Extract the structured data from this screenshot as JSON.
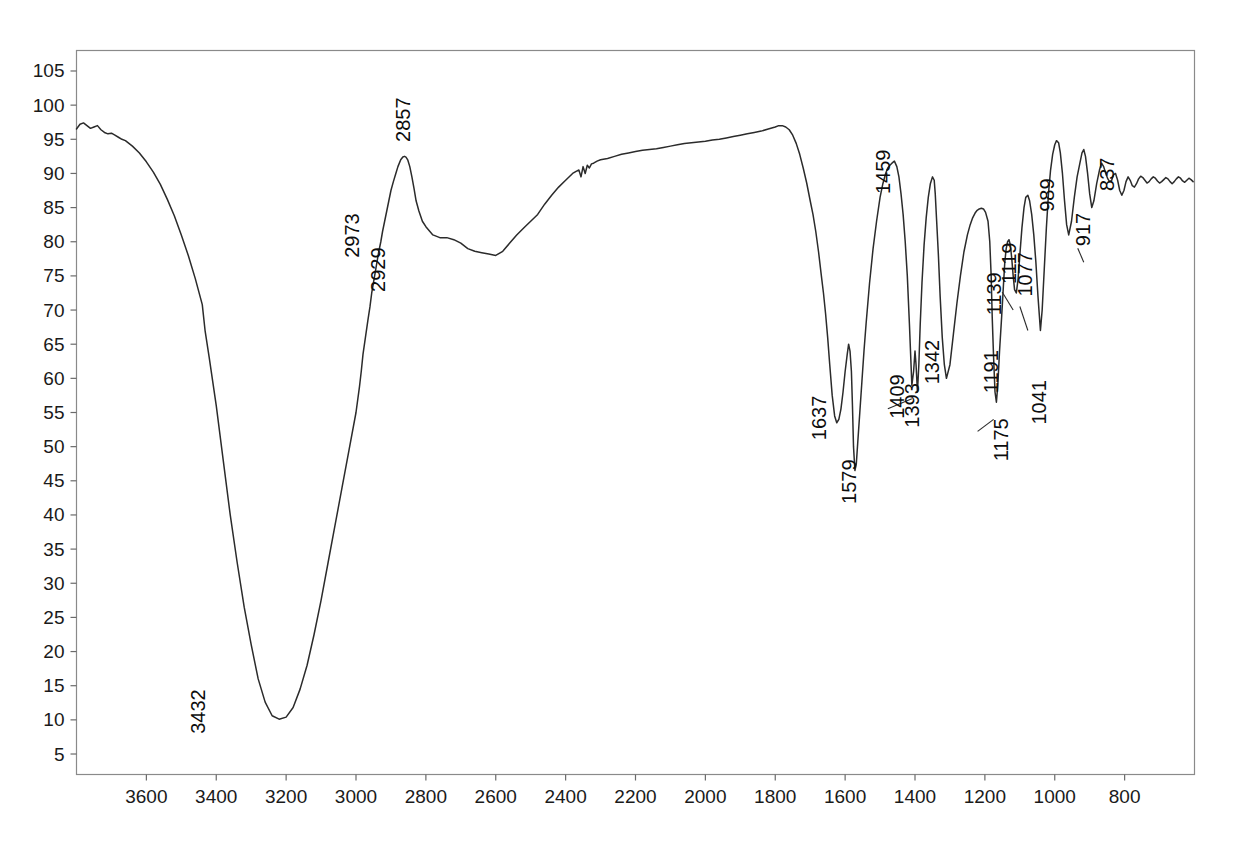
{
  "chart_data": {
    "type": "line",
    "title": "",
    "subtitle": "",
    "xlabel": "",
    "ylabel": "",
    "xlim": [
      3800,
      600
    ],
    "ylim": [
      2,
      108
    ],
    "x_axis_reversed": true,
    "grid": true,
    "legend": "none",
    "trace_color": "#2b2b2b",
    "grid_color": "#9aa0a6",
    "frame_color": "#8a8a8a",
    "x_ticks": [
      3600,
      3400,
      3200,
      3000,
      2800,
      2600,
      2400,
      2200,
      2000,
      1800,
      1600,
      1400,
      1200,
      1000,
      800
    ],
    "y_ticks": [
      5,
      10,
      15,
      20,
      25,
      30,
      35,
      40,
      45,
      50,
      55,
      60,
      65,
      70,
      75,
      80,
      85,
      90,
      95,
      100,
      105
    ],
    "x_tick_labels": [
      "3600",
      "3400",
      "3200",
      "3000",
      "2800",
      "2600",
      "2400",
      "2200",
      "2000",
      "1800",
      "1600",
      "1400",
      "1200",
      "1000",
      "800"
    ],
    "y_tick_labels": [
      "5",
      "10",
      "15",
      "20",
      "25",
      "30",
      "35",
      "40",
      "45",
      "50",
      "55",
      "60",
      "65",
      "70",
      "75",
      "80",
      "85",
      "90",
      "95",
      "100",
      "105"
    ],
    "annotations": [
      {
        "label": "3432",
        "wavenumber": 3432,
        "transmittance": 10
      },
      {
        "label": "2973",
        "wavenumber": 2973,
        "transmittance": 80
      },
      {
        "label": "2929",
        "wavenumber": 2929,
        "transmittance": 75
      },
      {
        "label": "2857",
        "wavenumber": 2857,
        "transmittance": 87
      },
      {
        "label": "1637",
        "wavenumber": 1637,
        "transmittance": 53
      },
      {
        "label": "1579",
        "wavenumber": 1579,
        "transmittance": 46
      },
      {
        "label": "1459",
        "wavenumber": 1459,
        "transmittance": 82
      },
      {
        "label": "1409",
        "wavenumber": 1409,
        "transmittance": 57
      },
      {
        "label": "1393",
        "wavenumber": 1393,
        "transmittance": 56
      },
      {
        "label": "1342",
        "wavenumber": 1342,
        "transmittance": 60
      },
      {
        "label": "1191",
        "wavenumber": 1191,
        "transmittance": 59
      },
      {
        "label": "1175",
        "wavenumber": 1175,
        "transmittance": 54
      },
      {
        "label": "1139",
        "wavenumber": 1139,
        "transmittance": 66
      },
      {
        "label": "1119",
        "wavenumber": 1119,
        "transmittance": 70
      },
      {
        "label": "1077",
        "wavenumber": 1077,
        "transmittance": 67
      },
      {
        "label": "1041",
        "wavenumber": 1041,
        "transmittance": 55
      },
      {
        "label": "989",
        "wavenumber": 989,
        "transmittance": 80
      },
      {
        "label": "917",
        "wavenumber": 917,
        "transmittance": 77
      },
      {
        "label": "837",
        "wavenumber": 837,
        "transmittance": 81
      }
    ],
    "x": [
      3800,
      3790,
      3780,
      3770,
      3760,
      3750,
      3740,
      3730,
      3720,
      3710,
      3700,
      3690,
      3680,
      3670,
      3660,
      3650,
      3640,
      3620,
      3600,
      3580,
      3560,
      3540,
      3520,
      3500,
      3480,
      3460,
      3440,
      3432,
      3420,
      3400,
      3380,
      3360,
      3340,
      3320,
      3300,
      3280,
      3260,
      3240,
      3220,
      3200,
      3180,
      3160,
      3140,
      3120,
      3100,
      3080,
      3060,
      3040,
      3020,
      3000,
      2990,
      2985,
      2980,
      2973,
      2966,
      2960,
      2955,
      2950,
      2945,
      2940,
      2935,
      2929,
      2924,
      2918,
      2912,
      2906,
      2900,
      2893,
      2886,
      2880,
      2872,
      2866,
      2861,
      2857,
      2852,
      2846,
      2840,
      2834,
      2828,
      2820,
      2810,
      2800,
      2780,
      2760,
      2740,
      2720,
      2700,
      2680,
      2660,
      2640,
      2620,
      2600,
      2580,
      2560,
      2540,
      2520,
      2500,
      2480,
      2460,
      2440,
      2420,
      2400,
      2380,
      2370,
      2362,
      2356,
      2350,
      2344,
      2338,
      2332,
      2326,
      2320,
      2310,
      2300,
      2280,
      2260,
      2240,
      2220,
      2200,
      2180,
      2160,
      2140,
      2120,
      2100,
      2080,
      2060,
      2040,
      2020,
      2000,
      1980,
      1960,
      1940,
      1920,
      1900,
      1880,
      1860,
      1840,
      1820,
      1800,
      1790,
      1780,
      1770,
      1760,
      1750,
      1740,
      1730,
      1720,
      1710,
      1700,
      1692,
      1684,
      1676,
      1668,
      1662,
      1656,
      1650,
      1644,
      1637,
      1630,
      1624,
      1618,
      1612,
      1606,
      1600,
      1594,
      1590,
      1586,
      1582,
      1579,
      1576,
      1572,
      1568,
      1564,
      1558,
      1552,
      1546,
      1540,
      1530,
      1520,
      1510,
      1500,
      1492,
      1484,
      1478,
      1472,
      1466,
      1459,
      1452,
      1446,
      1440,
      1434,
      1428,
      1422,
      1416,
      1409,
      1404,
      1400,
      1397,
      1393,
      1389,
      1385,
      1380,
      1374,
      1368,
      1362,
      1356,
      1350,
      1345,
      1342,
      1338,
      1333,
      1328,
      1322,
      1316,
      1310,
      1300,
      1290,
      1280,
      1270,
      1260,
      1250,
      1242,
      1235,
      1228,
      1222,
      1216,
      1210,
      1204,
      1198,
      1191,
      1186,
      1182,
      1179,
      1175,
      1171,
      1167,
      1163,
      1158,
      1152,
      1147,
      1143,
      1139,
      1135,
      1131,
      1127,
      1123,
      1119,
      1115,
      1110,
      1105,
      1100,
      1094,
      1088,
      1083,
      1077,
      1072,
      1066,
      1060,
      1054,
      1048,
      1041,
      1036,
      1030,
      1024,
      1018,
      1012,
      1006,
      1000,
      995,
      989,
      984,
      978,
      972,
      966,
      960,
      952,
      944,
      936,
      928,
      922,
      917,
      912,
      906,
      900,
      894,
      888,
      880,
      872,
      866,
      860,
      854,
      848,
      843,
      837,
      832,
      826,
      820,
      814,
      808,
      802,
      796,
      790,
      784,
      778,
      772,
      766,
      760,
      754,
      748,
      742,
      736,
      730,
      724,
      718,
      712,
      706,
      700,
      694,
      688,
      682,
      676,
      670,
      664,
      658,
      652,
      646,
      640,
      634,
      628,
      622,
      616,
      610,
      604
    ],
    "y": [
      96.5,
      97.2,
      97.4,
      97.0,
      96.6,
      96.8,
      97.0,
      96.4,
      96.0,
      95.8,
      95.9,
      95.6,
      95.3,
      95.0,
      94.8,
      94.4,
      94.0,
      93.0,
      91.7,
      90.2,
      88.4,
      86.2,
      83.8,
      81.0,
      78.0,
      74.6,
      70.8,
      67.0,
      63.0,
      56.0,
      48.0,
      40.0,
      33.0,
      26.5,
      21.0,
      16.0,
      12.6,
      10.6,
      10.1,
      10.4,
      11.8,
      14.5,
      18.0,
      22.5,
      27.5,
      33.0,
      38.5,
      44.0,
      49.5,
      55.0,
      58.8,
      61.0,
      63.5,
      66.0,
      68.5,
      70.5,
      72.5,
      74.0,
      75.5,
      77.0,
      78.5,
      80.0,
      81.5,
      83.0,
      84.5,
      86.0,
      87.5,
      88.8,
      90.0,
      91.0,
      92.0,
      92.4,
      92.5,
      92.4,
      92.0,
      91.0,
      89.5,
      87.8,
      86.0,
      84.5,
      83.0,
      82.2,
      81.0,
      80.6,
      80.6,
      80.3,
      79.8,
      79.0,
      78.6,
      78.4,
      78.2,
      78.0,
      78.6,
      79.8,
      81.0,
      82.0,
      83.0,
      84.0,
      85.5,
      86.8,
      88.0,
      89.0,
      90.0,
      90.3,
      90.5,
      89.5,
      91.0,
      90.0,
      91.2,
      90.8,
      91.4,
      91.5,
      91.8,
      92.0,
      92.2,
      92.5,
      92.8,
      93.0,
      93.2,
      93.4,
      93.5,
      93.6,
      93.8,
      94.0,
      94.2,
      94.4,
      94.5,
      94.6,
      94.7,
      94.9,
      95.0,
      95.2,
      95.4,
      95.6,
      95.8,
      96.0,
      96.2,
      96.5,
      96.8,
      97.0,
      97.0,
      96.8,
      96.4,
      95.6,
      94.4,
      92.8,
      90.8,
      88.6,
      86.0,
      84.0,
      81.5,
      78.5,
      75.0,
      72.5,
      69.5,
      66.0,
      62.0,
      57.5,
      54.5,
      53.5,
      54.0,
      55.5,
      58.0,
      61.0,
      63.5,
      65.0,
      64.0,
      61.0,
      56.0,
      50.0,
      46.5,
      47.5,
      50.5,
      55.0,
      59.5,
      64.0,
      68.0,
      74.0,
      79.0,
      83.0,
      86.5,
      88.5,
      90.0,
      90.8,
      91.2,
      91.5,
      91.8,
      91.0,
      89.5,
      87.0,
      84.0,
      80.0,
      75.0,
      68.0,
      59.0,
      61.0,
      64.0,
      62.0,
      58.0,
      62.0,
      68.0,
      74.0,
      79.5,
      83.5,
      86.5,
      88.5,
      89.5,
      89.0,
      87.0,
      83.0,
      78.0,
      72.0,
      66.0,
      62.0,
      60.0,
      62.0,
      66.5,
      71.0,
      75.0,
      78.5,
      81.0,
      82.5,
      83.5,
      84.2,
      84.6,
      84.8,
      84.9,
      84.8,
      84.3,
      83.0,
      80.0,
      75.0,
      69.0,
      63.0,
      58.0,
      56.5,
      59.0,
      64.0,
      69.0,
      73.5,
      77.0,
      79.0,
      80.0,
      80.3,
      79.5,
      77.5,
      75.0,
      73.0,
      72.5,
      74.5,
      78.0,
      82.0,
      85.0,
      86.5,
      86.8,
      86.0,
      84.0,
      81.0,
      77.0,
      72.0,
      67.0,
      70.0,
      76.0,
      82.0,
      87.0,
      90.5,
      92.8,
      94.2,
      94.8,
      94.5,
      93.0,
      90.0,
      86.0,
      82.5,
      81.0,
      83.0,
      86.5,
      89.5,
      91.5,
      93.0,
      93.5,
      92.5,
      90.0,
      87.0,
      85.0,
      86.0,
      88.5,
      90.5,
      91.5,
      91.0,
      90.0,
      89.2,
      88.8,
      89.0,
      89.8,
      90.0,
      89.0,
      87.5,
      86.8,
      87.5,
      88.8,
      89.5,
      89.0,
      88.2,
      88.0,
      88.5,
      89.2,
      89.6,
      89.4,
      89.0,
      88.6,
      88.8,
      89.2,
      89.5,
      89.3,
      88.9,
      88.6,
      88.8,
      89.1,
      89.4,
      89.2,
      88.8,
      88.5,
      88.8,
      89.2,
      89.5,
      89.3,
      88.9,
      88.7,
      89.0,
      89.3,
      89.1,
      88.8
    ]
  },
  "labels": {
    "p3432": "3432",
    "p2973": "2973",
    "p2929": "2929",
    "p2857": "2857",
    "p1637": "1637",
    "p1579": "1579",
    "p1459": "1459",
    "p1409": "1409",
    "p1393": "1393",
    "p1342": "1342",
    "p1191": "1191",
    "p1175": "1175",
    "p1139": "1139",
    "p1119": "1119",
    "p1077": "1077",
    "p1041": "1041",
    "p989": "989",
    "p917": "917",
    "p837": "837"
  }
}
